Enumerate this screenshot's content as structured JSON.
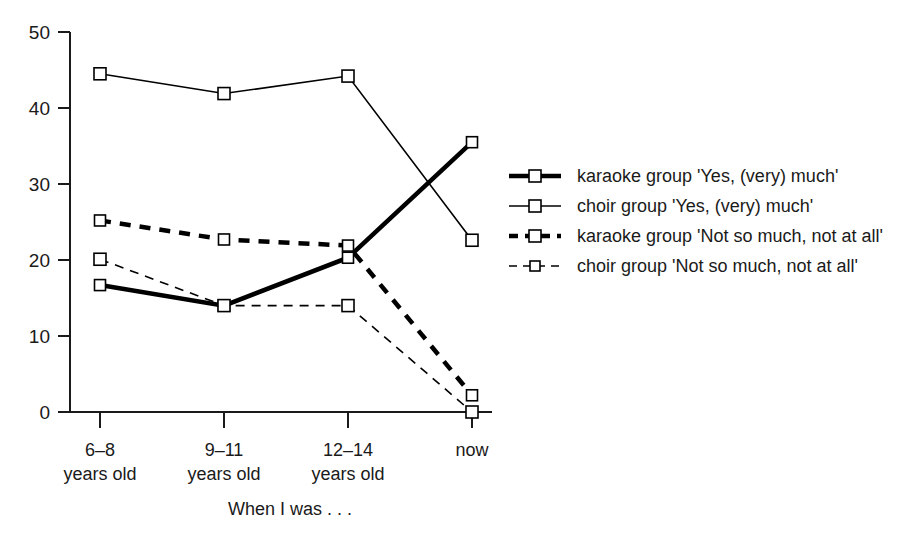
{
  "chart_data": {
    "type": "line",
    "title": "",
    "xlabel": "When I was . . .",
    "ylabel": "",
    "categories": [
      "6–8\nyears old",
      "9–11\nyears old",
      "12–14\nyears old",
      "now"
    ],
    "category_lines": [
      [
        "6–8",
        "years old"
      ],
      [
        "9–11",
        "years old"
      ],
      [
        "12–14",
        "years old"
      ],
      [
        "now",
        ""
      ]
    ],
    "ylim": [
      0,
      50
    ],
    "yticks": [
      0,
      10,
      20,
      30,
      40,
      50
    ],
    "ytick_labels": [
      "0",
      "10",
      "20",
      "30",
      "40",
      "50"
    ],
    "grid": false,
    "legend_position": "right",
    "series": [
      {
        "name": "karaoke group 'Yes, (very) much'",
        "values": [
          16.7,
          14.0,
          20.3,
          35.5
        ],
        "style": "solid",
        "width": "thick",
        "marker": "open-square"
      },
      {
        "name": "choir group 'Yes, (very) much'",
        "values": [
          44.5,
          41.9,
          44.2,
          22.6
        ],
        "style": "solid",
        "width": "thin",
        "marker": "open-square"
      },
      {
        "name": "karaoke group 'Not so much, not at all'",
        "values": [
          25.2,
          22.7,
          21.9,
          2.2
        ],
        "style": "dashed",
        "width": "thick",
        "marker": "open-square"
      },
      {
        "name": "choir group 'Not so much, not at all'",
        "values": [
          20.1,
          14.0,
          14.0,
          0.0
        ],
        "style": "dashed",
        "width": "thin",
        "marker": "open-square"
      }
    ],
    "colors": {
      "line": "#000000",
      "text": "#1a1a1a",
      "background": "#ffffff",
      "marker_fill": "#ffffff"
    }
  },
  "legend": {
    "items": [
      {
        "label": "karaoke group 'Yes, (very) much'"
      },
      {
        "label": "choir group 'Yes, (very) much'"
      },
      {
        "label": "karaoke group 'Not so much, not at all'"
      },
      {
        "label": "choir group 'Not so much, not at all'"
      }
    ]
  }
}
